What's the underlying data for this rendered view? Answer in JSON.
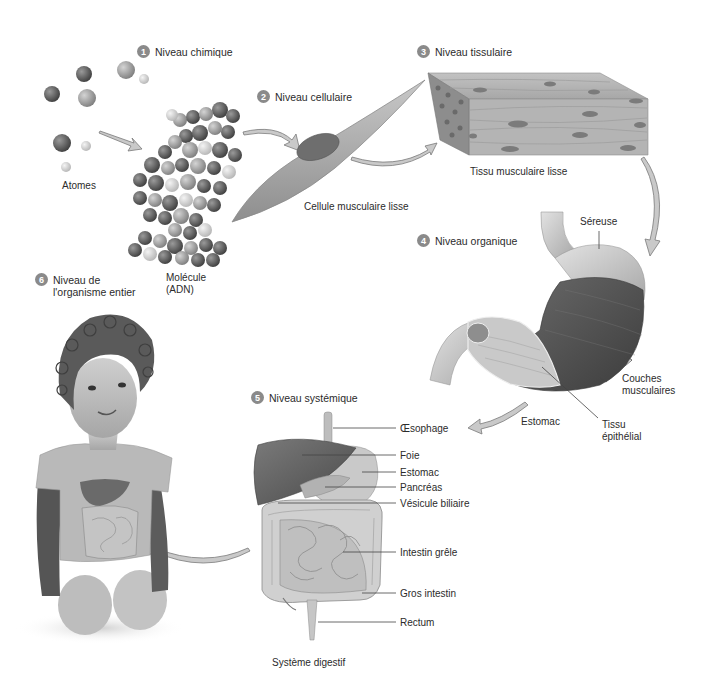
{
  "diagram": {
    "palette": {
      "background": "#ffffff",
      "text": "#2b2b2b",
      "badge": "#8a8a8a",
      "arrow_fill": "#c9c9c9",
      "arrow_stroke": "#7a7a7a",
      "leader_line": "#444444"
    },
    "levels": [
      {
        "number": "1",
        "label": "Niveau chimique"
      },
      {
        "number": "2",
        "label": "Niveau cellulaire"
      },
      {
        "number": "3",
        "label": "Niveau tissulaire"
      },
      {
        "number": "4",
        "label": "Niveau organique"
      },
      {
        "number": "5",
        "label": "Niveau systémique"
      },
      {
        "number": "6",
        "label_line1": "Niveau de",
        "label_line2": "l'organisme entier"
      }
    ],
    "captions": {
      "atoms": "Atomes",
      "molecule_line1": "Molécule",
      "molecule_line2": "(ADN)",
      "cell": "Cellule musculaire lisse",
      "tissue": "Tissu musculaire lisse",
      "system": "Système digestif"
    },
    "organ_labels": {
      "serosa": "Séreuse",
      "muscle_layers_line1": "Couches",
      "muscle_layers_line2": "musculaires",
      "stomach": "Estomac",
      "epithelial_line1": "Tissu",
      "epithelial_line2": "épithélial"
    },
    "system_labels": [
      "Œsophage",
      "Foie",
      "Estomac",
      "Pancréas",
      "Vésicule biliaire",
      "Intestin grêle",
      "Gros intestin",
      "Rectum"
    ]
  }
}
